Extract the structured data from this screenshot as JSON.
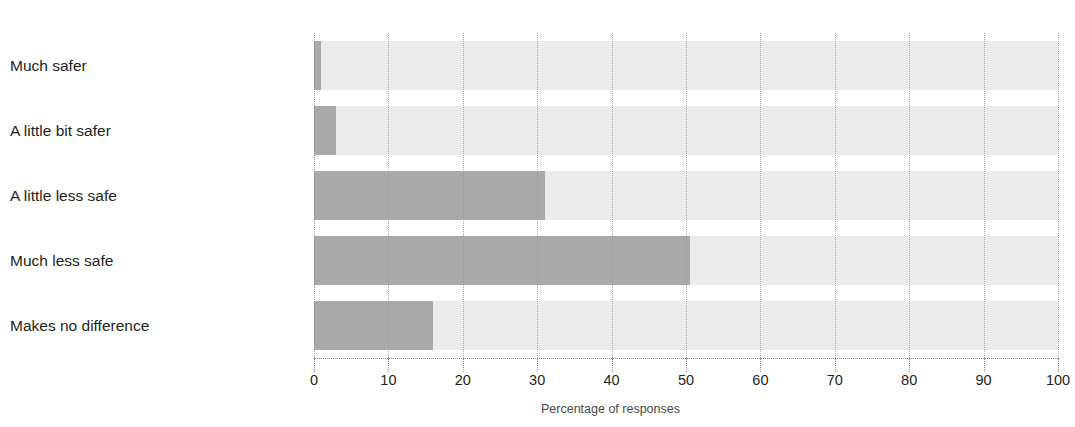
{
  "chart_data": {
    "type": "bar",
    "orientation": "horizontal",
    "title": "",
    "subtitle": "",
    "categories": [
      "Much safer",
      "A little bit safer",
      "A little less safe",
      "Much less safe",
      "Makes no difference"
    ],
    "values": [
      1,
      3,
      31,
      50.5,
      16
    ],
    "xlabel": "Percentage of responses",
    "ylabel": "",
    "xlim": [
      0,
      100
    ],
    "xticks": [
      0,
      10,
      20,
      30,
      40,
      50,
      60,
      70,
      80,
      90,
      100
    ],
    "xtick_labels": [
      "0",
      "10",
      "20",
      "30",
      "40",
      "50",
      "60",
      "70",
      "80",
      "90",
      "100"
    ],
    "grid": "vertical-dotted",
    "legend": "none",
    "colors": {
      "bar_fill": "#a9a9a9",
      "bar_track": "#ebebeb",
      "gridline": "#9b9b9b",
      "text": "#231f20",
      "background": "#ffffff"
    }
  }
}
